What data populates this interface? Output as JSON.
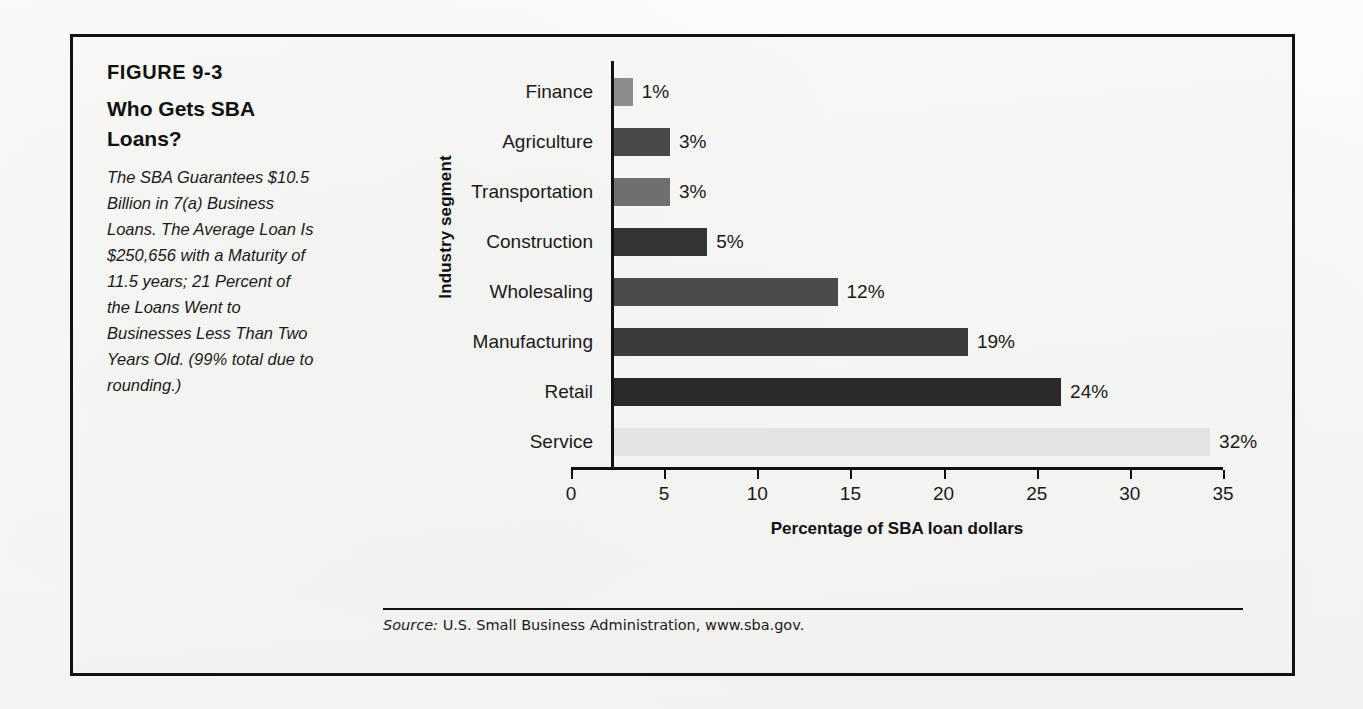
{
  "figure": {
    "number": "FIGURE 9-3",
    "title": "Who Gets SBA Loans?",
    "caption": "The SBA Guarantees $10.5 Billion in 7(a) Business Loans. The Average Loan Is $250,656 with a Maturity of 11.5 years; 21 Percent of the Loans Went to Businesses Less Than Two Years Old. (99% total due to rounding.)",
    "source_label": "Source:",
    "source_text": "U.S. Small Business Administration, www.sba.gov."
  },
  "chart_data": {
    "type": "bar",
    "orientation": "horizontal",
    "title": "Who Gets SBA Loans?",
    "xlabel": "Percentage of SBA loan dollars",
    "ylabel": "Industry segment",
    "xlim": [
      0,
      35
    ],
    "xticks": [
      0,
      5,
      10,
      15,
      20,
      25,
      30,
      35
    ],
    "xtick_labels": [
      "0",
      "5",
      "10",
      "15",
      "20",
      "25",
      "30",
      "35"
    ],
    "grid": false,
    "legend": "none",
    "categories": [
      "Finance",
      "Agriculture",
      "Transportation",
      "Construction",
      "Wholesaling",
      "Manufacturing",
      "Retail",
      "Service"
    ],
    "values": [
      1,
      3,
      3,
      5,
      12,
      19,
      24,
      32
    ],
    "value_labels": [
      "1%",
      "3%",
      "3%",
      "5%",
      "12%",
      "19%",
      "24%",
      "32%"
    ],
    "bar_colors": [
      "#8c8c8c",
      "#494949",
      "#6f6f6f",
      "#333333",
      "#4b4b4b",
      "#3b3b3b",
      "#2a2a2a",
      "#e3e3e3"
    ],
    "annotation": "99% total due to rounding."
  },
  "colors": {
    "frame": "#111111",
    "axis": "#111111",
    "text": "#1a1a1a",
    "paper": "#f6f6f4"
  }
}
